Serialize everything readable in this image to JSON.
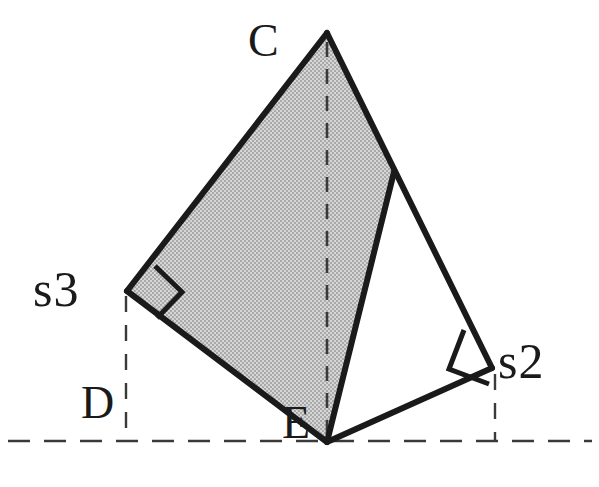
{
  "figure": {
    "type": "geometry-diagram",
    "background_color": "#ffffff",
    "stroke_color": "#1a1a1a",
    "shaded_fill_color": "#c0c0c0",
    "dash_color": "#3a3a3a",
    "solid_stroke_width": 5,
    "dashed_stroke_width": 2.4,
    "labels": {
      "apex": "C",
      "left_foot": "s3",
      "right_foot": "s2",
      "baseline_left": "D",
      "baseline_mid": "E"
    },
    "points": {
      "C": {
        "x": 327,
        "y": 33
      },
      "s3": {
        "x": 127,
        "y": 291
      },
      "s2": {
        "x": 492,
        "y": 368
      },
      "E": {
        "x": 327,
        "y": 442
      },
      "branch": {
        "x": 394,
        "y": 172
      },
      "D_baseline": {
        "x": 126,
        "y": 441
      },
      "s2_baseline": {
        "x": 495,
        "y": 441
      }
    },
    "baseline": {
      "y": 441,
      "x_start": 8,
      "x_end": 592
    },
    "dashed_verticals": [
      {
        "name": "s3-to-baseline",
        "x": 126,
        "y_start": 296,
        "y_end": 441
      },
      {
        "name": "s2-to-baseline",
        "x": 495,
        "y_start": 372,
        "y_end": 441
      }
    ],
    "dashed_altitude": {
      "name": "C-to-E",
      "x": 327,
      "y_start": 40,
      "y_end": 438
    },
    "right_angle_markers": [
      {
        "at": "s3",
        "size": 38
      },
      {
        "at": "s2",
        "size": 38
      }
    ],
    "shaded_polygon": [
      "C",
      "s3",
      "E"
    ]
  }
}
